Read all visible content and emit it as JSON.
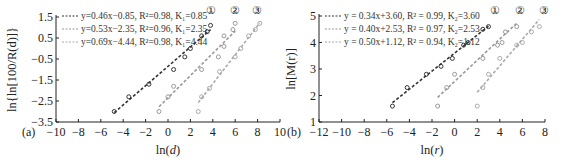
{
  "chart_data": [
    {
      "panel": "(a)",
      "type": "scatter",
      "xlabel": "ln(d)",
      "ylabel": "ln{ln[100/R(d)]}",
      "xlim": [
        -10,
        10
      ],
      "ylim": [
        -3.5,
        1.5
      ],
      "xticks": [
        "-10",
        "-8",
        "-6",
        "-4",
        "-2",
        "0",
        "2",
        "4",
        "6",
        "8",
        "10"
      ],
      "yticks": [
        "1.5",
        "0.5",
        "-0.5",
        "-1.5",
        "-2.5",
        "-3.5"
      ],
      "grid": false,
      "legend_position": "upper-left",
      "series": [
        {
          "name": "①",
          "label": "y=0.46x−0.85, R²=0.98, K₁=0.85",
          "color": "#333333",
          "slope": 0.46,
          "intercept": -0.85,
          "points": [
            [
              -4.8,
              -3.0
            ],
            [
              -3.5,
              -2.3
            ],
            [
              -1.7,
              -1.7
            ],
            [
              0.5,
              -1.0
            ],
            [
              1.5,
              -0.4
            ],
            [
              2.0,
              0.0
            ],
            [
              3.0,
              0.6
            ],
            [
              3.5,
              0.8
            ],
            [
              3.8,
              1.1
            ]
          ]
        },
        {
          "name": "②",
          "label": "y=0.53x−2.35, R²=0.96, K₁=2.35",
          "color": "#999999",
          "slope": 0.53,
          "intercept": -2.35,
          "points": [
            [
              -0.8,
              -3.0
            ],
            [
              0.0,
              -2.3
            ],
            [
              0.5,
              -1.8
            ],
            [
              3.0,
              -1.0
            ],
            [
              4.5,
              -0.4
            ],
            [
              5.0,
              0.1
            ],
            [
              5.0,
              0.6
            ],
            [
              5.8,
              0.9
            ],
            [
              6.0,
              1.2
            ]
          ]
        },
        {
          "name": "③",
          "label": "y=0.69x−4.44, R²=0.98, K₁=4.44",
          "color": "#aaaaaa",
          "slope": 0.69,
          "intercept": -4.44,
          "points": [
            [
              2.7,
              -3.0
            ],
            [
              3.0,
              -2.3
            ],
            [
              3.7,
              -1.9
            ],
            [
              4.6,
              -1.1
            ],
            [
              6.0,
              -0.4
            ],
            [
              6.5,
              0.0
            ],
            [
              7.2,
              0.6
            ],
            [
              7.8,
              0.9
            ],
            [
              8.2,
              1.2
            ]
          ]
        }
      ]
    },
    {
      "panel": "(b)",
      "type": "scatter",
      "xlabel": "ln(r)",
      "ylabel": "ln[M(r)]",
      "xlim": [
        -12,
        8
      ],
      "ylim": [
        1,
        5
      ],
      "xticks": [
        "-12",
        "-10",
        "-8",
        "-6",
        "-4",
        "-2",
        "0",
        "2",
        "4",
        "6",
        "8"
      ],
      "yticks": [
        "5",
        "4",
        "3",
        "2",
        "1"
      ],
      "grid": false,
      "legend_position": "upper-left",
      "series": [
        {
          "name": "①",
          "label": "y = 0.34x+3.60, R² = 0.99, K₂=3.60",
          "color": "#333333",
          "slope": 0.34,
          "intercept": 3.6,
          "points": [
            [
              -5.5,
              1.6
            ],
            [
              -4.2,
              2.3
            ],
            [
              -2.5,
              2.8
            ],
            [
              -1.2,
              3.1
            ],
            [
              -0.2,
              3.4
            ],
            [
              0.8,
              3.9
            ],
            [
              1.2,
              4.0
            ],
            [
              2.5,
              4.5
            ],
            [
              3.0,
              4.6
            ]
          ]
        },
        {
          "name": "②",
          "label": "y = 0.40x+2.53, R² = 0.97, K₂=2.53",
          "color": "#999999",
          "slope": 0.4,
          "intercept": 2.53,
          "points": [
            [
              -1.5,
              1.6
            ],
            [
              -0.7,
              2.3
            ],
            [
              0.0,
              2.8
            ],
            [
              2.5,
              3.4
            ],
            [
              3.8,
              3.9
            ],
            [
              4.2,
              4.0
            ],
            [
              4.5,
              4.4
            ],
            [
              5.5,
              4.6
            ]
          ]
        },
        {
          "name": "③",
          "label": "y = 0.50x+1.12, R² = 0.94, K₂=1.12",
          "color": "#aaaaaa",
          "slope": 0.5,
          "intercept": 1.12,
          "points": [
            [
              2.0,
              1.6
            ],
            [
              2.5,
              2.3
            ],
            [
              3.0,
              2.8
            ],
            [
              4.0,
              3.4
            ],
            [
              5.5,
              3.9
            ],
            [
              6.0,
              4.0
            ],
            [
              6.8,
              4.4
            ],
            [
              7.5,
              4.6
            ]
          ]
        }
      ]
    }
  ]
}
